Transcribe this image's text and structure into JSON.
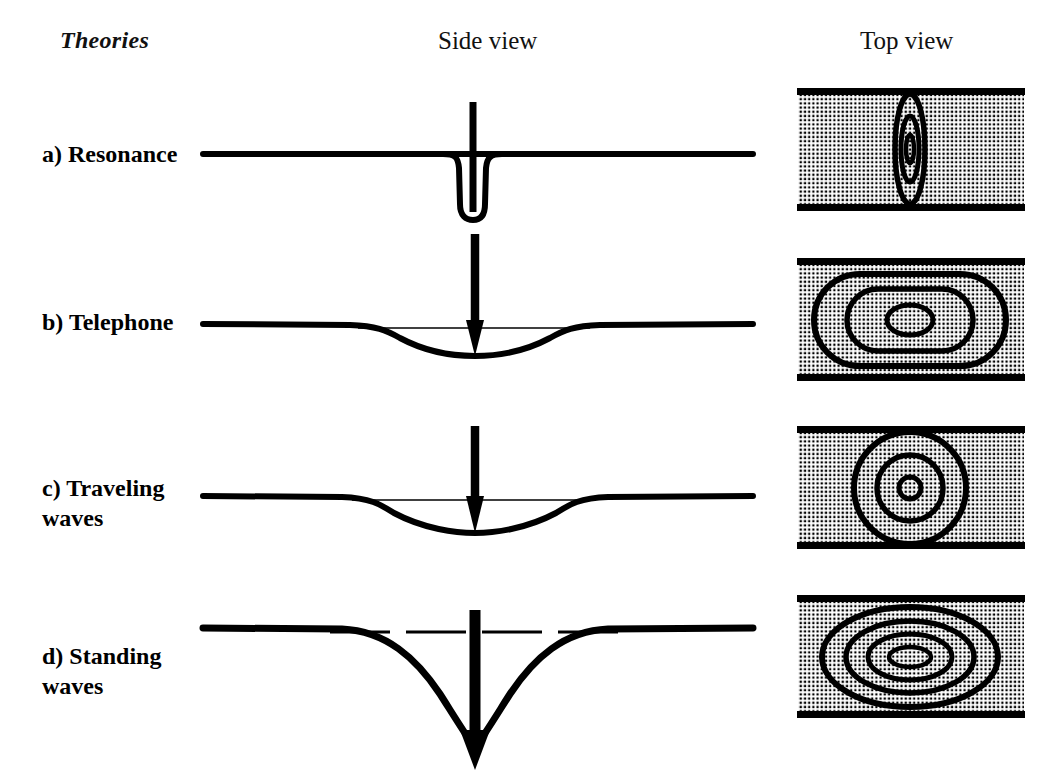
{
  "figure": {
    "kind": "scientific-diagram",
    "background_color": "#ffffff",
    "ink_color": "#000000",
    "columns": {
      "theories_label": "Theories",
      "side_view_label": "Side view",
      "top_view_label": "Top view"
    },
    "rows": [
      {
        "id": "a",
        "label": "a) Resonance",
        "side_view": {
          "description": "flat membrane baseline with a narrow deep U-shaped notch at center, vertical arrow shaft descending into the notch",
          "deflection_shape": "narrow-deep-u",
          "deflection_width_px": 46,
          "deflection_depth_px": 74,
          "reference_line": "none",
          "arrow": {
            "style": "plain-shaft",
            "head": "none",
            "length_px": 100
          }
        },
        "top_view": {
          "description": "stippled channel with a single narrow vertical elongated contour family at center",
          "contour_count": 3,
          "contour_shape": "narrow-vertical-ellipse",
          "contours": [
            {
              "rx": 15,
              "ry": 55
            },
            {
              "rx": 9,
              "ry": 33
            },
            {
              "rx": 4,
              "ry": 14
            }
          ]
        }
      },
      {
        "id": "b",
        "label": "b) Telephone",
        "side_view": {
          "description": "flat baseline with a broad shallow dip; thin straight chord line spans the dip; downward arrow meets the dip floor",
          "deflection_shape": "broad-shallow-bowl",
          "deflection_width_px": 230,
          "deflection_depth_px": 26,
          "reference_line": "solid-thin-chord",
          "arrow": {
            "style": "thick-shaft",
            "head": "solid-triangle",
            "length_px": 122
          }
        },
        "top_view": {
          "description": "stippled channel with three nested stadium-shaped (rounded rectangle) contours, widest almost filling the channel",
          "contour_count": 3,
          "contour_shape": "stadium",
          "contours": [
            {
              "rx": 96,
              "ry": 46,
              "corner": 46
            },
            {
              "rx": 63,
              "ry": 31,
              "corner": 31
            },
            {
              "rx": 23,
              "ry": 15,
              "corner": 15
            }
          ]
        }
      },
      {
        "id": "c",
        "label": "c) Traveling\nwaves",
        "side_view": {
          "description": "flat baseline with a broad dip slightly deeper than row b; thin straight chord line spans the dip; downward arrow meets the dip floor",
          "deflection_shape": "broad-bowl",
          "deflection_width_px": 250,
          "deflection_depth_px": 32,
          "reference_line": "solid-thin-chord",
          "arrow": {
            "style": "thick-shaft",
            "head": "solid-triangle",
            "length_px": 112
          }
        },
        "top_view": {
          "description": "stippled channel with three concentric circles centered in the channel",
          "contour_count": 3,
          "contour_shape": "circle",
          "contours": [
            {
              "r": 56
            },
            {
              "r": 33
            },
            {
              "r": 11
            }
          ]
        }
      },
      {
        "id": "d",
        "label": "d) Standing\nwaves",
        "side_view": {
          "description": "flat baseline with a deep narrow funnel-shaped depression reaching far below; dashed horizontal reference line at baseline level across the funnel; large heavy arrow with solid head pointing down to the funnel apex",
          "deflection_shape": "deep-funnel",
          "deflection_width_px": 320,
          "deflection_depth_px": 120,
          "reference_line": "dashed",
          "arrow": {
            "style": "heavy-shaft",
            "head": "solid-triangle-large",
            "length_px": 128
          }
        },
        "top_view": {
          "description": "stippled channel with four nested ellipses, outermost nearly filling the channel height",
          "contour_count": 4,
          "contour_shape": "ellipse",
          "contours": [
            {
              "rx": 88,
              "ry": 50
            },
            {
              "rx": 64,
              "ry": 36
            },
            {
              "rx": 42,
              "ry": 23
            },
            {
              "rx": 21,
              "ry": 10
            }
          ]
        }
      }
    ],
    "top_view_panel": {
      "width_px": 230,
      "height_px": 126,
      "fill": "stipple-dot-grid",
      "dot_pitch_px": 4.2,
      "border": "thick-solid-top-and-bottom-only",
      "border_thickness_px": 7
    },
    "side_view_panel": {
      "baseline_length_px": 560,
      "baseline_thickness_px": 6
    }
  }
}
